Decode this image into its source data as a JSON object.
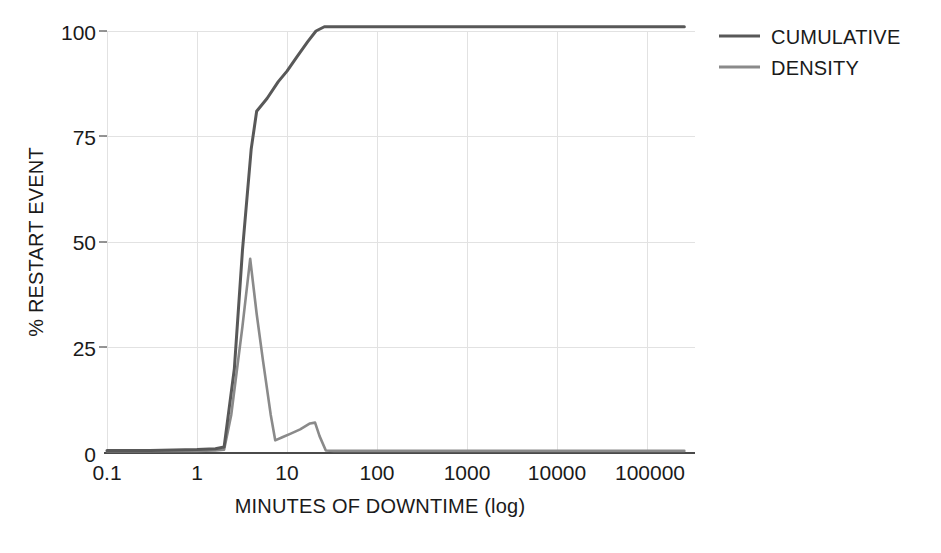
{
  "chart_data": {
    "type": "line",
    "title": "",
    "subtitle": "",
    "xlabel": "MINUTES OF DOWNTIME (log)",
    "ylabel": "% RESTART EVENT",
    "xscale": "log",
    "xlim": [
      0.1,
      300000
    ],
    "ylim": [
      0,
      101
    ],
    "grid": true,
    "legend_position": "top-right",
    "x_tick_labels": [
      "0.1",
      "1",
      "10",
      "100",
      "1000",
      "10000",
      "100000"
    ],
    "x_tick_values": [
      0.1,
      1,
      10,
      100,
      1000,
      10000,
      100000
    ],
    "y_tick_labels": [
      "0",
      "25",
      "50",
      "75",
      "100"
    ],
    "y_tick_values": [
      0,
      25,
      50,
      75,
      100
    ],
    "series": [
      {
        "name": "CUMULATIVE",
        "color": "#585858",
        "x": [
          0.1,
          0.3,
          1.0,
          1.6,
          2.0,
          2.6,
          3.2,
          4.0,
          4.6,
          6.0,
          8.0,
          10.0,
          13.0,
          17.0,
          21.0,
          26.0,
          40.0,
          100.0,
          1000.0,
          10000.0,
          100000.0,
          260000.0
        ],
        "y": [
          0.6,
          0.6,
          0.8,
          1.0,
          1.4,
          20.0,
          48.0,
          72.0,
          81.0,
          84.0,
          88.0,
          90.5,
          94.0,
          97.5,
          100.0,
          101.0,
          101.0,
          101.0,
          101.0,
          101.0,
          101.0,
          101.0
        ]
      },
      {
        "name": "DENSITY",
        "color": "#8a8a8a",
        "x": [
          0.1,
          0.3,
          1.0,
          1.6,
          2.0,
          2.4,
          3.2,
          3.9,
          4.6,
          5.4,
          6.6,
          7.4,
          9.0,
          11.0,
          14.0,
          18.0,
          20.5,
          23.0,
          27.0,
          33.0,
          60.0,
          300.0,
          3000.0,
          30000.0,
          260000.0
        ],
        "y": [
          0.4,
          0.4,
          0.5,
          0.6,
          0.8,
          9.0,
          30.0,
          46.0,
          33.0,
          22.0,
          9.0,
          3.0,
          3.8,
          4.6,
          5.6,
          7.0,
          7.2,
          4.0,
          0.6,
          0.5,
          0.5,
          0.5,
          0.5,
          0.5,
          0.5
        ]
      }
    ],
    "annotations": []
  },
  "legend": {
    "items": [
      {
        "label": "CUMULATIVE",
        "color": "#585858"
      },
      {
        "label": "DENSITY",
        "color": "#8a8a8a"
      }
    ]
  },
  "axes": {
    "x_title": "MINUTES OF DOWNTIME (log)",
    "y_title": "% RESTART EVENT",
    "x_ticks": [
      "0.1",
      "1",
      "10",
      "100",
      "1000",
      "10000",
      "100000"
    ],
    "y_ticks": [
      "100",
      "75",
      "50",
      "25",
      "0"
    ]
  },
  "colors": {
    "background": "#ffffff",
    "gridline": "#e2e2e2",
    "axis": "#4a4a4a",
    "text": "#1a1a1a",
    "cumulative": "#585858",
    "density": "#8a8a8a"
  }
}
